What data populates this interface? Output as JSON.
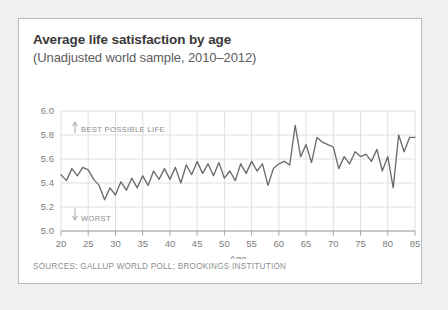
{
  "card": {
    "title": "Average life satisfaction by age",
    "subtitle": "(Unadjusted world sample, 2010–2012)",
    "sources": "SOURCES: GALLUP WORLD POLL; BROOKINGS INSTITUTION",
    "border_color": "#b9b9b9",
    "background_color": "#ffffff",
    "page_background_color": "#f0f0ee"
  },
  "annotations": {
    "best": "BEST POSSIBLE LIFE",
    "worst": "WORST"
  },
  "chart_data": {
    "type": "line",
    "title": "Average life satisfaction by age",
    "subtitle": "(Unadjusted world sample, 2010–2012)",
    "xlabel": "Age",
    "ylabel": "",
    "xlim": [
      20,
      85
    ],
    "ylim": [
      5.0,
      6.0
    ],
    "grid": true,
    "legend": "none",
    "line_color": "#6b6b6b",
    "xticks": [
      20,
      25,
      30,
      35,
      40,
      45,
      50,
      55,
      60,
      65,
      70,
      75,
      80,
      85
    ],
    "yticks": [
      "5.0",
      "5.2",
      "5.4",
      "5.6",
      "5.8",
      "6.0"
    ],
    "ytick_values": [
      5.0,
      5.2,
      5.4,
      5.6,
      5.8,
      6.0
    ],
    "x": [
      20,
      21,
      22,
      23,
      24,
      25,
      26,
      27,
      28,
      29,
      30,
      31,
      32,
      33,
      34,
      35,
      36,
      37,
      38,
      39,
      40,
      41,
      42,
      43,
      44,
      45,
      46,
      47,
      48,
      49,
      50,
      51,
      52,
      53,
      54,
      55,
      56,
      57,
      58,
      59,
      60,
      61,
      62,
      63,
      64,
      65,
      66,
      67,
      68,
      69,
      70,
      71,
      72,
      73,
      74,
      75,
      76,
      77,
      78,
      79,
      80,
      81,
      82,
      83,
      84,
      85
    ],
    "values": [
      5.47,
      5.42,
      5.52,
      5.46,
      5.53,
      5.51,
      5.43,
      5.38,
      5.26,
      5.36,
      5.3,
      5.41,
      5.34,
      5.44,
      5.36,
      5.46,
      5.38,
      5.5,
      5.43,
      5.52,
      5.43,
      5.53,
      5.4,
      5.55,
      5.47,
      5.58,
      5.48,
      5.56,
      5.46,
      5.57,
      5.44,
      5.5,
      5.42,
      5.56,
      5.48,
      5.58,
      5.5,
      5.56,
      5.38,
      5.52,
      5.56,
      5.58,
      5.55,
      5.88,
      5.62,
      5.72,
      5.57,
      5.78,
      5.74,
      5.72,
      5.7,
      5.52,
      5.62,
      5.56,
      5.66,
      5.62,
      5.64,
      5.58,
      5.68,
      5.5,
      5.62,
      5.36,
      5.8,
      5.66,
      5.78,
      5.78
    ]
  }
}
